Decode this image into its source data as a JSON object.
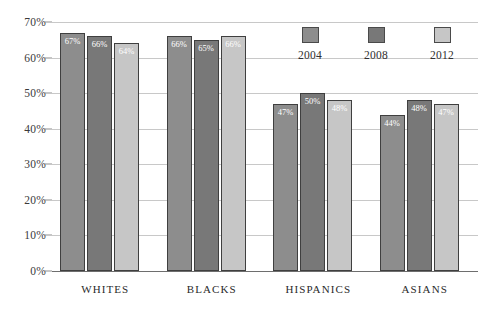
{
  "chart_data": {
    "type": "bar",
    "title": "",
    "subtitle": "",
    "xlabel": "",
    "ylabel": "",
    "categories": [
      "WHITES",
      "BLACKS",
      "HISPANICS",
      "ASIANS"
    ],
    "series": [
      {
        "name": "2004",
        "color": "#8d8d8d",
        "values": [
          67,
          66,
          47,
          44
        ],
        "labels": [
          "67%",
          "66%",
          "47%",
          "44%"
        ]
      },
      {
        "name": "2008",
        "color": "#787878",
        "values": [
          66,
          65,
          50,
          48
        ],
        "labels": [
          "66%",
          "65%",
          "50%",
          "48%"
        ]
      },
      {
        "name": "2012",
        "color": "#c6c6c6",
        "values": [
          64,
          66,
          48,
          47
        ],
        "labels": [
          "64%",
          "66%",
          "48%",
          "47%"
        ]
      }
    ],
    "ylim": [
      0,
      70
    ],
    "ytick_values": [
      70,
      60,
      50,
      40,
      30,
      20,
      10,
      0
    ],
    "ytick_labels": [
      "70%",
      "60%",
      "50%",
      "40%",
      "30%",
      "20%",
      "10%",
      "0%"
    ],
    "grid": true,
    "legend_position": "top-right",
    "legend_entries": [
      "2004",
      "2008",
      "2012"
    ],
    "gridline_color": "#c8c8c8",
    "axis_color": "#6e6e6e",
    "bar_border_color": "#3f3f3f",
    "data_label_color": "#ffffff"
  }
}
